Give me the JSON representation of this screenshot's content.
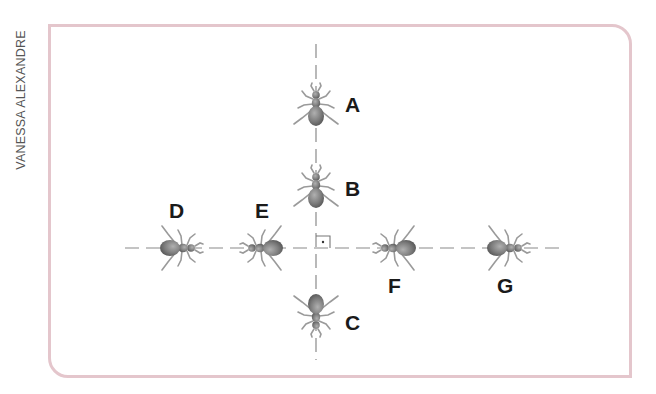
{
  "credit": "VANESSA ALEXANDRE",
  "colors": {
    "frame_border": "#e4c6cc",
    "ant_body": "#7a7a7a",
    "axis_line": "#888888",
    "label": "#1a1a1a"
  },
  "axes": {
    "vertical": {
      "x": 316,
      "y_start": 44,
      "y_end": 360,
      "style": "dashed"
    },
    "horizontal": {
      "y": 248,
      "x_start": 125,
      "x_end": 560,
      "style": "dashed"
    },
    "right_angle_marker": {
      "x": 316,
      "y": 248
    }
  },
  "ants": [
    {
      "id": "A",
      "label": "A",
      "x": 316,
      "y": 108,
      "orientation": "up"
    },
    {
      "id": "B",
      "label": "B",
      "x": 316,
      "y": 190,
      "orientation": "up"
    },
    {
      "id": "C",
      "label": "C",
      "x": 316,
      "y": 312,
      "orientation": "down"
    },
    {
      "id": "D",
      "label": "D",
      "x": 178,
      "y": 248,
      "orientation": "right"
    },
    {
      "id": "E",
      "label": "E",
      "x": 265,
      "y": 248,
      "orientation": "left"
    },
    {
      "id": "F",
      "label": "F",
      "x": 398,
      "y": 248,
      "orientation": "left"
    },
    {
      "id": "G",
      "label": "G",
      "x": 505,
      "y": 248,
      "orientation": "right"
    }
  ],
  "labels": {
    "A": "A",
    "B": "B",
    "C": "C",
    "D": "D",
    "E": "E",
    "F": "F",
    "G": "G"
  }
}
